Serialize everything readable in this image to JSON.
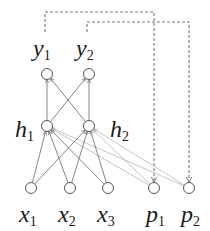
{
  "diagram": {
    "type": "neural-network",
    "nodes": {
      "y1": {
        "label": "y",
        "sub": "1",
        "cx": 47,
        "cy": 74
      },
      "y2": {
        "label": "y",
        "sub": "2",
        "cx": 89,
        "cy": 74
      },
      "h1": {
        "label": "h",
        "sub": "1",
        "cx": 47,
        "cy": 126
      },
      "h2": {
        "label": "h",
        "sub": "2",
        "cx": 89,
        "cy": 126
      },
      "x1": {
        "label": "x",
        "sub": "1",
        "cx": 31,
        "cy": 188
      },
      "x2": {
        "label": "x",
        "sub": "2",
        "cx": 70,
        "cy": 188
      },
      "x3": {
        "label": "x",
        "sub": "3",
        "cx": 108,
        "cy": 188
      },
      "p1": {
        "label": "p",
        "sub": "1",
        "cx": 154,
        "cy": 188
      },
      "p2": {
        "label": "p",
        "sub": "2",
        "cx": 189,
        "cy": 188
      }
    },
    "solid_edges": [
      [
        "x1",
        "h1"
      ],
      [
        "x1",
        "h2"
      ],
      [
        "x2",
        "h1"
      ],
      [
        "x2",
        "h2"
      ],
      [
        "x3",
        "h1"
      ],
      [
        "x3",
        "h2"
      ],
      [
        "h1",
        "y1"
      ],
      [
        "h1",
        "y2"
      ],
      [
        "h2",
        "y1"
      ],
      [
        "h2",
        "y2"
      ]
    ],
    "light_edges": [
      [
        "p1",
        "h1"
      ],
      [
        "p1",
        "h2"
      ],
      [
        "p2",
        "h1"
      ],
      [
        "p2",
        "h2"
      ]
    ],
    "dashed_edges": [
      [
        "y1",
        "p1"
      ],
      [
        "y2",
        "p2"
      ]
    ],
    "colors": {
      "node_stroke": "#555555",
      "solid_edge": "#666666",
      "light_edge": "#b5b5b5",
      "dashed_edge": "#777777",
      "text": "#1a1a1a"
    }
  }
}
